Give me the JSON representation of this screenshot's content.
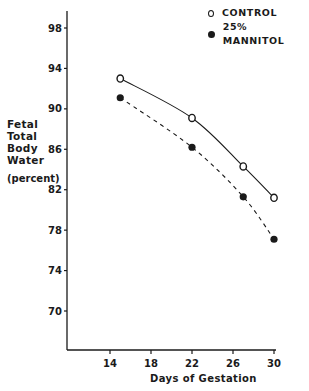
{
  "chart_data": {
    "type": "line",
    "title": "",
    "xlabel": "Days of Gestation",
    "ylabel": "Fetal Total Body Water (percent)",
    "ylabel_lines": [
      "Fetal",
      "Total",
      "Body",
      "Water"
    ],
    "ylabel_unit": "(percent)",
    "xlim": [
      11,
      30
    ],
    "ylim": [
      66,
      100
    ],
    "xticks": [
      14,
      18,
      22,
      26,
      30
    ],
    "xtick_labels": [
      "14",
      "18",
      "22",
      "26",
      "30"
    ],
    "yticks": [
      70,
      74,
      78,
      82,
      86,
      90,
      94,
      98
    ],
    "grid": false,
    "legend_position": "top-right",
    "series": [
      {
        "name": "CONTROL",
        "marker": "open-circle",
        "line": "solid",
        "x": [
          15,
          22,
          27,
          30
        ],
        "values": [
          93.0,
          89.1,
          84.3,
          81.2
        ]
      },
      {
        "name": "25% MANNITOL",
        "marker": "filled-circle",
        "line": "dashed",
        "x": [
          15,
          22,
          27,
          30
        ],
        "values": [
          91.1,
          86.2,
          81.3,
          77.1
        ]
      }
    ]
  },
  "legend": {
    "items": [
      {
        "label": "CONTROL",
        "marker": "open-circle"
      },
      {
        "label": "25% MANNITOL",
        "marker": "filled-circle"
      }
    ]
  },
  "colors": {
    "ink": "#1a1a1a",
    "background": "#ffffff"
  }
}
